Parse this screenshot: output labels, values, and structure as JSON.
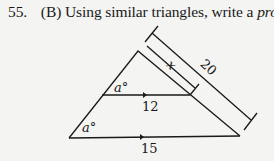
{
  "problem": {
    "number": "55.",
    "part": "(B)",
    "text_before": "Using similar triangles, write a",
    "emphasis": "proportion.",
    "figure": {
      "angle_top": "a°",
      "angle_bottom": "a°",
      "mid_base": "12",
      "bottom_base": "15",
      "side_unknown": "x",
      "side_full": "20"
    }
  }
}
